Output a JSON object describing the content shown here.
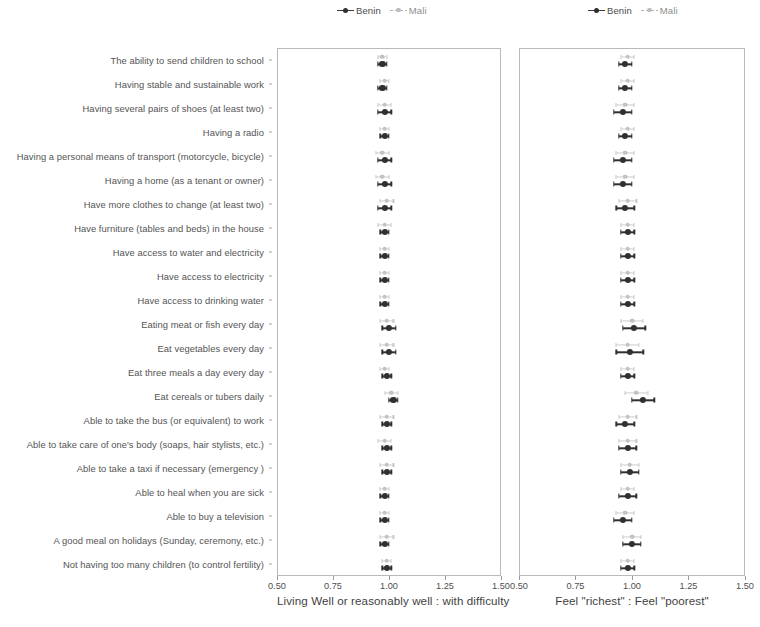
{
  "figure": {
    "width": 760,
    "height": 627,
    "background": "#ffffff"
  },
  "legend": {
    "benin_label": "Benin",
    "mali_label": "Mali",
    "benin_color": "#2e2e2e",
    "mali_color": "#bdbdbd"
  },
  "categories": [
    "The ability to send children to school",
    "Having stable and sustainable work",
    "Having several pairs of shoes (at least two)",
    "Having a radio",
    "Having a personal means of transport (motorcycle, bicycle)",
    "Having a home (as a tenant or owner)",
    "Have more clothes to change (at least two)",
    "Have furniture (tables and beds) in the house",
    "Have access to water and electricity",
    "Have access to electricity",
    "Have access to drinking water",
    "Eating meat or fish every day",
    "Eat vegetables every day",
    "Eat three meals a day every day",
    "Eat cereals or tubers daily",
    "Able to take the bus (or equivalent) to work",
    "Able to take care of one's body (soaps, hair stylists, etc.)",
    "Able to take a taxi if necessary (emergency )",
    "Able to heal when you are sick",
    "Able to buy a television",
    "A good meal on holidays (Sunday, ceremony, etc.)",
    "Not having too many children (to control fertility)"
  ],
  "xaxis": {
    "ticks": [
      0.5,
      0.75,
      1.0,
      1.25,
      1.5
    ],
    "ticklabels": [
      "0.50",
      "0.75",
      "1.00",
      "1.25",
      "1.50"
    ],
    "min": 0.5,
    "max": 1.5
  },
  "chart_data": [
    {
      "type": "scatter",
      "panel": "left",
      "title": "",
      "xlabel": "Living Well or reasonably well : with difficulty",
      "ylabel": "",
      "xlim": [
        0.5,
        1.5
      ],
      "grid": false,
      "legend_position": "top-center",
      "categories": [
        "The ability to send children to school",
        "Having stable and sustainable work",
        "Having several pairs of shoes (at least two)",
        "Having a radio",
        "Having a personal means of transport (motorcycle, bicycle)",
        "Having a home (as a tenant or owner)",
        "Have more clothes to change (at least two)",
        "Have furniture (tables and beds) in the house",
        "Have access to water and electricity",
        "Have access to electricity",
        "Have access to drinking water",
        "Eating meat or fish every day",
        "Eat vegetables every day",
        "Eat three meals a day every day",
        "Eat cereals or tubers daily",
        "Able to take the bus (or equivalent) to work",
        "Able to take care of one's body (soaps, hair stylists, etc.)",
        "Able to take a taxi if necessary (emergency )",
        "Able to heal when you are sick",
        "Able to buy a television",
        "A good meal on holidays (Sunday, ceremony, etc.)",
        "Not having too many children (to control fertility)"
      ],
      "series": [
        {
          "name": "Benin",
          "color": "#2e2e2e",
          "values": [
            0.97,
            0.97,
            0.98,
            0.98,
            0.98,
            0.98,
            0.98,
            0.98,
            0.98,
            0.98,
            0.98,
            1.0,
            1.0,
            0.99,
            1.02,
            0.99,
            0.99,
            0.99,
            0.98,
            0.98,
            0.98,
            0.99
          ],
          "ci_low": [
            0.95,
            0.95,
            0.95,
            0.96,
            0.95,
            0.95,
            0.95,
            0.96,
            0.96,
            0.96,
            0.96,
            0.97,
            0.97,
            0.97,
            1.0,
            0.97,
            0.97,
            0.97,
            0.96,
            0.96,
            0.96,
            0.97
          ],
          "ci_high": [
            0.99,
            0.99,
            1.01,
            1.0,
            1.01,
            1.01,
            1.01,
            1.0,
            1.0,
            1.0,
            1.0,
            1.03,
            1.03,
            1.01,
            1.04,
            1.01,
            1.01,
            1.01,
            1.0,
            1.0,
            1.0,
            1.01
          ]
        },
        {
          "name": "Mali",
          "color": "#bdbdbd",
          "values": [
            0.97,
            0.98,
            0.98,
            0.98,
            0.97,
            0.97,
            0.99,
            0.98,
            0.98,
            0.98,
            0.98,
            0.99,
            0.99,
            0.98,
            1.01,
            0.99,
            0.98,
            0.99,
            0.98,
            0.98,
            0.99,
            0.99
          ],
          "ci_low": [
            0.95,
            0.96,
            0.95,
            0.96,
            0.94,
            0.94,
            0.96,
            0.95,
            0.96,
            0.96,
            0.96,
            0.96,
            0.96,
            0.96,
            0.98,
            0.96,
            0.95,
            0.96,
            0.96,
            0.96,
            0.96,
            0.97
          ],
          "ci_high": [
            0.99,
            1.0,
            1.01,
            1.0,
            1.0,
            1.0,
            1.02,
            1.01,
            1.0,
            1.0,
            1.0,
            1.02,
            1.02,
            1.0,
            1.04,
            1.02,
            1.01,
            1.02,
            1.0,
            1.0,
            1.02,
            1.01
          ]
        }
      ]
    },
    {
      "type": "scatter",
      "panel": "right",
      "title": "",
      "xlabel": "Feel \"richest\" : Feel \"poorest\"",
      "ylabel": "",
      "xlim": [
        0.5,
        1.5
      ],
      "grid": false,
      "legend_position": "top-center",
      "categories": [
        "The ability to send children to school",
        "Having stable and sustainable work",
        "Having several pairs of shoes (at least two)",
        "Having a radio",
        "Having a personal means of transport (motorcycle, bicycle)",
        "Having a home (as a tenant or owner)",
        "Have more clothes to change (at least two)",
        "Have furniture (tables and beds) in the house",
        "Have access to water and electricity",
        "Have access to electricity",
        "Have access to drinking water",
        "Eating meat or fish every day",
        "Eat vegetables every day",
        "Eat three meals a day every day",
        "Eat cereals or tubers daily",
        "Able to take the bus (or equivalent) to work",
        "Able to take care of one's body (soaps, hair stylists, etc.)",
        "Able to take a taxi if necessary (emergency )",
        "Able to heal when you are sick",
        "Able to buy a television",
        "A good meal on holidays (Sunday, ceremony, etc.)",
        "Not having too many children (to control fertility)"
      ],
      "series": [
        {
          "name": "Benin",
          "color": "#2e2e2e",
          "values": [
            0.97,
            0.97,
            0.96,
            0.97,
            0.96,
            0.96,
            0.97,
            0.98,
            0.98,
            0.98,
            0.98,
            1.01,
            0.99,
            0.98,
            1.05,
            0.97,
            0.98,
            0.99,
            0.98,
            0.96,
            1.0,
            0.98
          ],
          "ci_low": [
            0.94,
            0.94,
            0.92,
            0.94,
            0.92,
            0.92,
            0.93,
            0.95,
            0.95,
            0.95,
            0.95,
            0.96,
            0.93,
            0.95,
            1.0,
            0.93,
            0.94,
            0.95,
            0.94,
            0.92,
            0.96,
            0.95
          ],
          "ci_high": [
            1.0,
            1.0,
            1.0,
            1.0,
            1.0,
            1.0,
            1.01,
            1.01,
            1.01,
            1.01,
            1.01,
            1.06,
            1.05,
            1.01,
            1.1,
            1.01,
            1.02,
            1.03,
            1.02,
            1.0,
            1.04,
            1.01
          ]
        },
        {
          "name": "Mali",
          "color": "#bdbdbd",
          "values": [
            0.98,
            0.98,
            0.97,
            0.98,
            0.97,
            0.97,
            0.98,
            0.98,
            0.98,
            0.98,
            0.98,
            1.0,
            0.98,
            0.98,
            1.02,
            0.98,
            0.98,
            0.99,
            0.98,
            0.97,
            1.0,
            0.98
          ],
          "ci_low": [
            0.95,
            0.95,
            0.93,
            0.95,
            0.93,
            0.93,
            0.94,
            0.95,
            0.95,
            0.95,
            0.95,
            0.95,
            0.93,
            0.95,
            0.97,
            0.94,
            0.94,
            0.95,
            0.95,
            0.93,
            0.96,
            0.95
          ],
          "ci_high": [
            1.01,
            1.01,
            1.01,
            1.01,
            1.01,
            1.01,
            1.02,
            1.01,
            1.01,
            1.01,
            1.01,
            1.05,
            1.03,
            1.01,
            1.07,
            1.02,
            1.02,
            1.03,
            1.01,
            1.01,
            1.04,
            1.01
          ]
        }
      ]
    }
  ]
}
